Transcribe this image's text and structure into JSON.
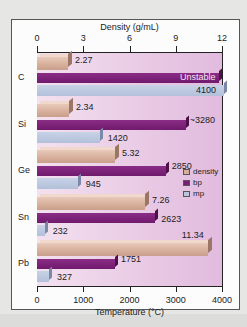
{
  "chart_data": {
    "type": "bar",
    "orientation": "horizontal",
    "categories": [
      "C",
      "Si",
      "Ge",
      "Sn",
      "Pb"
    ],
    "series": [
      {
        "name": "density",
        "axis": "top",
        "unit": "g/mL",
        "values": [
          2.27,
          2.34,
          5.32,
          7.26,
          11.34
        ],
        "labels": [
          "2.27",
          "2.34",
          "5.32",
          "7.26",
          "11.34"
        ],
        "color": "#d6ae9a"
      },
      {
        "name": "bp",
        "axis": "bottom",
        "unit": "°C",
        "values": [
          null,
          3280,
          2850,
          2623,
          1751
        ],
        "labels": [
          "Unstable",
          "~3280",
          "2850",
          "2623",
          "1751"
        ],
        "color": "#7a1f77"
      },
      {
        "name": "mp",
        "axis": "bottom",
        "unit": "°C",
        "values": [
          4100,
          1420,
          945,
          232,
          327
        ],
        "labels": [
          "4100",
          "1420",
          "945",
          "232",
          "327"
        ],
        "color": "#b9c5dd"
      }
    ],
    "top_axis": {
      "title": "Density (g/mL)",
      "ticks": [
        "0",
        "3",
        "6",
        "9",
        "12"
      ],
      "range": [
        0,
        12
      ]
    },
    "bottom_axis": {
      "title": "Temperature  (°C)",
      "ticks": [
        "0",
        "1000",
        "2000",
        "3000",
        "4000"
      ],
      "range": [
        0,
        4000
      ]
    },
    "legend": {
      "position": "right-middle",
      "entries": [
        "density",
        "bp",
        "mp"
      ]
    },
    "grid": false
  }
}
